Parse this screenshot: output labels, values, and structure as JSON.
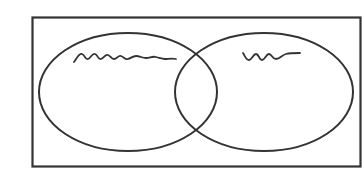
{
  "diagram": {
    "type": "venn",
    "sets": [
      {
        "name": "left-set",
        "label_placeholder": "squiggle",
        "label_length": "long"
      },
      {
        "name": "right-set",
        "label_placeholder": "squiggle",
        "label_length": "short"
      }
    ],
    "universe": {
      "shape": "rectangle"
    },
    "colors": {
      "stroke": "#333333",
      "background": "#ffffff"
    }
  }
}
